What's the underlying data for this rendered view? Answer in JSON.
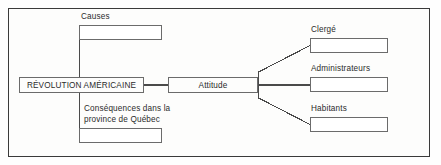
{
  "diagram": {
    "title_node": {
      "label": "RÉVOLUTION AMÉRICAINE"
    },
    "center_node": {
      "label": "Attitude"
    },
    "left_branches": [
      {
        "caption": "Causes",
        "answer": ""
      },
      {
        "caption": "Conséquences dans la\nprovince de Québec",
        "answer": ""
      }
    ],
    "right_branches": [
      {
        "caption": "Clergé",
        "answer": ""
      },
      {
        "caption": "Administrateurs",
        "answer": ""
      },
      {
        "caption": "Habitants",
        "answer": ""
      }
    ]
  },
  "style": {
    "frame_border": "#3a3a3a",
    "box_border": "#6b6b6b",
    "line": "#4a4a4a",
    "text": "#2b2b2b",
    "page_background": "#fdfdfc"
  }
}
